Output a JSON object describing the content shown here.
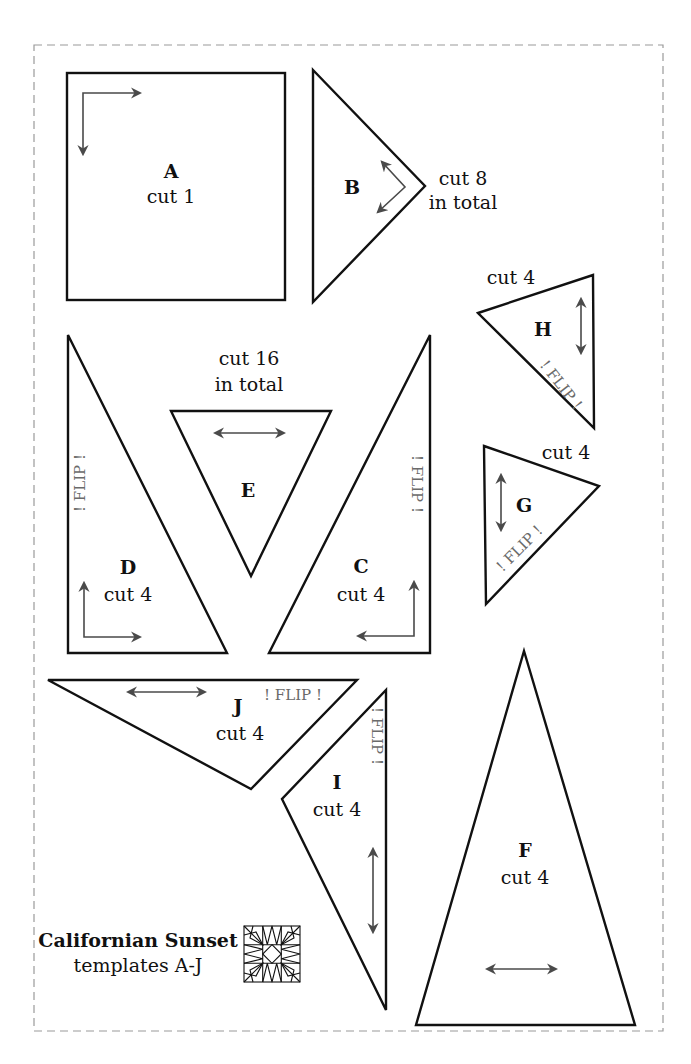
{
  "diagram": {
    "title": "Californian Sunset",
    "subtitle": "templates A-J",
    "icon": "quilt-block-icon"
  },
  "templates": {
    "A": {
      "letter": "A",
      "cut": "cut 1"
    },
    "B": {
      "letter": "B",
      "cut": "cut 8",
      "cut2": "in total"
    },
    "C": {
      "letter": "C",
      "cut": "cut 4",
      "flip": "! FLIP !"
    },
    "D": {
      "letter": "D",
      "cut": "cut 4",
      "flip": "! FLIP !"
    },
    "E": {
      "letter": "E",
      "cut": "cut 16",
      "cut2": "in total"
    },
    "F": {
      "letter": "F",
      "cut": "cut 4"
    },
    "G": {
      "letter": "G",
      "cut": "cut 4",
      "flip": "! FLIP !"
    },
    "H": {
      "letter": "H",
      "cut": "cut 4",
      "flip": "! FLIP !"
    },
    "I": {
      "letter": "I",
      "cut": "cut 4",
      "flip": "! FLIP !"
    },
    "J": {
      "letter": "J",
      "cut": "cut 4",
      "flip": "! FLIP !"
    }
  },
  "colors": {
    "outline": "#111111",
    "grain_arrow": "#4a4a4a",
    "flip_text": "#6a6a6a",
    "cut_border": "#9a9a9a"
  }
}
